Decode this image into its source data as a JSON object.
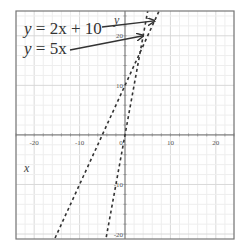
{
  "chart_data": {
    "type": "line",
    "title": "",
    "xlabel": "x",
    "ylabel": "y",
    "xlim": [
      -24,
      24
    ],
    "ylim": [
      -21,
      25
    ],
    "grid": true,
    "x_ticks": [
      -20,
      -10,
      0,
      10,
      20
    ],
    "y_ticks": [
      -20,
      -10,
      10,
      20
    ],
    "x_tick_labels": [
      "-20",
      "-10",
      "0",
      "10",
      "20"
    ],
    "y_tick_labels": [
      "-20",
      "-10",
      "10",
      "20"
    ],
    "series": [
      {
        "name": "y = 2x + 10",
        "equation": "y = 2x + 10",
        "slope": 2,
        "intercept": 10,
        "style": "dashed"
      },
      {
        "name": "y = 5x",
        "equation": "y = 5x",
        "slope": 5,
        "intercept": 0,
        "style": "dashed"
      }
    ],
    "annotations": [
      {
        "text": "y = 2x + 10",
        "arrow_to": [
          6.5,
          23
        ]
      },
      {
        "text": "y = 5x",
        "arrow_to": [
          4,
          20
        ]
      }
    ]
  },
  "labels": {
    "eq1_prefix": "y",
    "eq1_rest": " = 2x + 10",
    "eq2_prefix": "y",
    "eq2_rest": " = 5x",
    "x_axis": "x",
    "y_axis": "y"
  }
}
